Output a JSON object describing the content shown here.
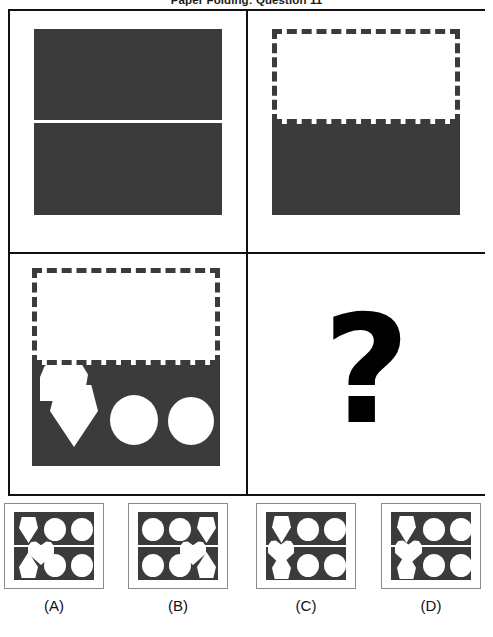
{
  "title": "Paper Folding: Question 11",
  "puzzle": {
    "type": "paper-folding",
    "question_number": 11,
    "fold_axis": "horizontal",
    "fold_direction": "top-half-folded-down",
    "sheet_color": "#3b3b3b",
    "background_color": "#ffffff",
    "ghost_outline_style": "dashed",
    "missing_panel_marker": "?"
  },
  "panels": [
    {
      "id": "panel-1",
      "name": "unfolded-sheet",
      "caption": "",
      "description": "Full square sheet with a horizontal fold crease across the middle",
      "shapes": []
    },
    {
      "id": "panel-2",
      "name": "folded-sheet",
      "caption": "",
      "description": "Top half folded down; dashed ghost shows the folded-away half",
      "shapes": []
    },
    {
      "id": "panel-3",
      "name": "punched-sheet",
      "caption": "",
      "description": "Folded sheet with punched holes: half-heart lobe on the fold, pentagon, two circles",
      "shapes": [
        {
          "kind": "lobe",
          "label": "half-heart-lobe",
          "on_fold": true
        },
        {
          "kind": "pentagon",
          "label": "pentagon-point-down",
          "on_fold": false
        },
        {
          "kind": "circle",
          "label": "circle-middle",
          "on_fold": false
        },
        {
          "kind": "circle",
          "label": "circle-right",
          "on_fold": false
        }
      ]
    },
    {
      "id": "panel-4",
      "name": "answer-placeholder",
      "caption": "?",
      "description": "Unknown unfolded result",
      "shapes": []
    }
  ],
  "options": [
    {
      "id": "A",
      "label": "(A)",
      "top_row": [
        "pentagon-down",
        "circle",
        "circle"
      ],
      "bottom_row": [
        "pentagon-up",
        "circle",
        "circle"
      ],
      "heart_position": "left-center-on-fold",
      "mirrored": false
    },
    {
      "id": "B",
      "label": "(B)",
      "top_row": [
        "circle",
        "circle",
        "pentagon-down"
      ],
      "bottom_row": [
        "circle",
        "circle",
        "pentagon-up"
      ],
      "heart_position": "right-center-on-fold",
      "mirrored": true
    },
    {
      "id": "C",
      "label": "(C)",
      "top_row": [
        "pentagon-down",
        "circle",
        "circle"
      ],
      "bottom_row": [
        "pentagon-up",
        "circle",
        "circle"
      ],
      "heart_position": "left-edge-on-fold",
      "mirrored": false
    },
    {
      "id": "D",
      "label": "(D)",
      "top_row": [
        "pentagon-down",
        "circle",
        "circle"
      ],
      "bottom_row": [
        "pentagon-up",
        "circle",
        "circle"
      ],
      "heart_position": "left-center-on-fold",
      "mirrored": false
    }
  ]
}
